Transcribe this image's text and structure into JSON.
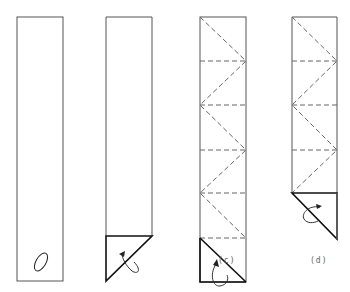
{
  "figure": {
    "panels": [
      {
        "id": "a",
        "label": "",
        "description": "plain strip with loop symbol"
      },
      {
        "id": "b",
        "label": "",
        "description": "strip with bottom corner folded triangle and turn-over arrow"
      },
      {
        "id": "c",
        "label": "(c)",
        "description": "strip with dashed zig-zag fold lines, triangle at bottom, turn-over arrow"
      },
      {
        "id": "d",
        "label": "(d)",
        "description": "strip with dashed zig-zag fold lines, triangle folded below, turn-over arrow"
      }
    ],
    "colors": {
      "line": "#444444",
      "bold": "#111111",
      "dash": "#666666"
    }
  }
}
